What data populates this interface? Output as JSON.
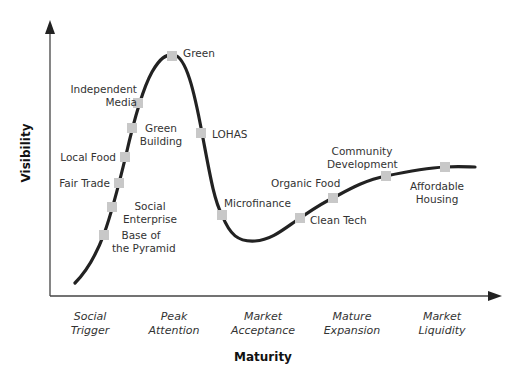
{
  "axes": {
    "y_label": "Visibility",
    "x_label": "Maturity"
  },
  "phases": [
    {
      "line1": "Social",
      "line2": "Trigger"
    },
    {
      "line1": "Peak",
      "line2": "Attention"
    },
    {
      "line1": "Market",
      "line2": "Acceptance"
    },
    {
      "line1": "Mature",
      "line2": "Expansion"
    },
    {
      "line1": "Market",
      "line2": "Liquidity"
    }
  ],
  "points": [
    {
      "line1": "Base of",
      "line2": "the Pyramid"
    },
    {
      "line1": "Social",
      "line2": "Enterprise"
    },
    {
      "line1": "Fair Trade",
      "line2": ""
    },
    {
      "line1": "Local Food",
      "line2": ""
    },
    {
      "line1": "Green",
      "line2": "Building"
    },
    {
      "line1": "Independent",
      "line2": "Media"
    },
    {
      "line1": "Green",
      "line2": ""
    },
    {
      "line1": "LOHAS",
      "line2": ""
    },
    {
      "line1": "Microfinance",
      "line2": ""
    },
    {
      "line1": "Clean Tech",
      "line2": ""
    },
    {
      "line1": "Organic Food",
      "line2": ""
    },
    {
      "line1": "Community",
      "line2": "Development"
    },
    {
      "line1": "Affordable",
      "line2": "Housing"
    }
  ],
  "colors": {
    "curve": "#222222",
    "marker": "#c8c8c8",
    "axis": "#444444"
  }
}
